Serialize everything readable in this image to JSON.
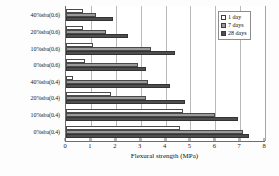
{
  "chart_data": {
    "type": "bar",
    "orientation": "horizontal",
    "title": "",
    "xlabel": "Flexural strength (MPa)",
    "ylabel": "",
    "xlim": [
      0,
      8
    ],
    "xticks": [
      0,
      1,
      2,
      3,
      4,
      5,
      6,
      7,
      8
    ],
    "grid": true,
    "legend_position": "top-right",
    "categories": [
      "40%sba(0.6)",
      "20%sba(0.6)",
      "10%sba(0.6)",
      "0%sba(0.6)",
      "40%sba(0.4)",
      "20%sba(0.4)",
      "10%sba(0.4)",
      "0%sba(0.4)"
    ],
    "series": [
      {
        "name": "1 day",
        "color": "#ffffff",
        "values": [
          0.7,
          0.7,
          1.1,
          0.75,
          0.3,
          1.8,
          4.7,
          4.6
        ]
      },
      {
        "name": "7 days",
        "color": "#9a9a9a",
        "values": [
          1.2,
          1.6,
          3.4,
          2.9,
          3.3,
          3.2,
          6.0,
          7.1
        ]
      },
      {
        "name": "28 days",
        "color": "#4e4e4e",
        "values": [
          1.9,
          2.5,
          4.4,
          3.2,
          4.2,
          4.8,
          6.9,
          7.35
        ]
      }
    ]
  },
  "legend": {
    "items": [
      {
        "label": "1 day"
      },
      {
        "label": "7 days"
      },
      {
        "label": "28 days"
      }
    ]
  }
}
